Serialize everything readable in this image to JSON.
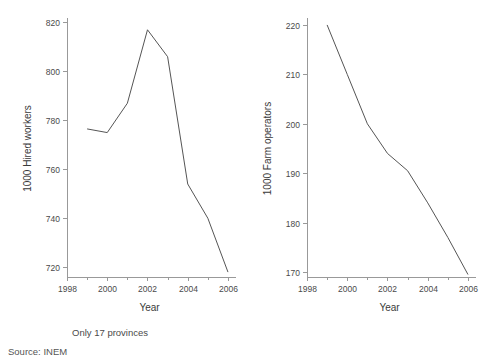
{
  "figure": {
    "background": "#ffffff",
    "line_color": "#555555",
    "axis_color": "#999999",
    "text_color": "#3a3a3a"
  },
  "notes": {
    "provinces": "Only 17 provinces",
    "source": "Source: INEM"
  },
  "chart_data": [
    {
      "type": "line",
      "title": "",
      "xlabel": "Year",
      "ylabel": "1000 Hired workers",
      "xlim": [
        1998,
        2006.2
      ],
      "ylim": [
        716,
        821
      ],
      "xticks": [
        1998,
        2000,
        2002,
        2004,
        2006
      ],
      "xtick_labels": [
        "1998",
        "2000",
        "2002",
        "2004",
        "2006"
      ],
      "xminor_ticks": [
        1999,
        2001,
        2003,
        2005
      ],
      "yticks": [
        720,
        740,
        760,
        780,
        800,
        820
      ],
      "ytick_labels": [
        "720",
        "740",
        "760",
        "780",
        "800",
        "820"
      ],
      "grid": false,
      "legend": "none",
      "x": [
        1999,
        2000,
        2001,
        2002,
        2003,
        2004,
        2005,
        2006
      ],
      "values": [
        776.5,
        775,
        787,
        817,
        806,
        754,
        740,
        718
      ],
      "series": [
        {
          "name": "1000 Hired workers",
          "x": [
            1999,
            2000,
            2001,
            2002,
            2003,
            2004,
            2005,
            2006
          ],
          "values": [
            776.5,
            775,
            787,
            817,
            806,
            754,
            740,
            718
          ]
        }
      ]
    },
    {
      "type": "line",
      "title": "",
      "xlabel": "Year",
      "ylabel": "1000 Farm operators",
      "xlim": [
        1998,
        2006.2
      ],
      "ylim": [
        169,
        221
      ],
      "xticks": [
        1998,
        2000,
        2002,
        2004,
        2006
      ],
      "xtick_labels": [
        "1998",
        "2000",
        "2002",
        "2004",
        "2006"
      ],
      "xminor_ticks": [
        1999,
        2001,
        2003,
        2005
      ],
      "yticks": [
        170,
        180,
        190,
        200,
        210,
        220
      ],
      "ytick_labels": [
        "170",
        "180",
        "190",
        "200",
        "210",
        "220"
      ],
      "grid": false,
      "legend": "none",
      "x": [
        1999,
        2000,
        2001,
        2002,
        2003,
        2004,
        2005,
        2006
      ],
      "values": [
        220,
        210,
        200,
        194,
        190.5,
        184,
        177,
        169.5
      ],
      "series": [
        {
          "name": "1000 Farm operators",
          "x": [
            1999,
            2000,
            2001,
            2002,
            2003,
            2004,
            2005,
            2006
          ],
          "values": [
            220,
            210,
            200,
            194,
            190.5,
            184,
            177,
            169.5
          ]
        }
      ]
    }
  ]
}
